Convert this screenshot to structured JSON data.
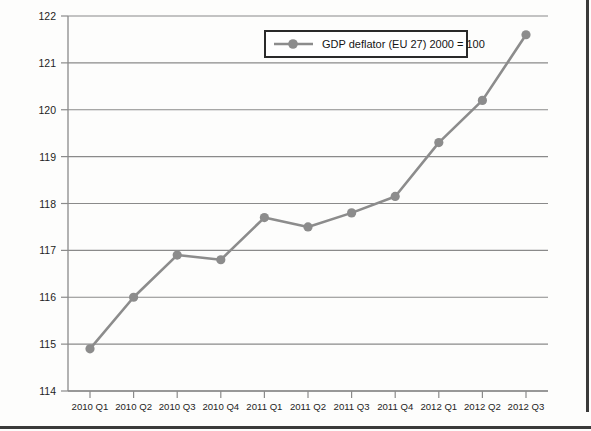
{
  "chart_data": {
    "type": "line",
    "title": "",
    "subtitle": "",
    "xlabel": "",
    "ylabel": "",
    "categories": [
      "2010 Q1",
      "2010 Q2",
      "2010 Q3",
      "2010 Q4",
      "2011 Q1",
      "2011 Q2",
      "2011 Q3",
      "2011 Q4",
      "2012 Q1",
      "2012 Q2",
      "2012 Q3"
    ],
    "series": [
      {
        "name": "GDP deflator (EU 27) 2000 = 100",
        "values": [
          114.9,
          116.0,
          116.9,
          116.8,
          117.7,
          117.5,
          117.8,
          118.15,
          119.3,
          120.2,
          121.6
        ],
        "color": "#8c8c8c",
        "marker": "circle"
      }
    ],
    "ylim": [
      114,
      122
    ],
    "ytick_labels": [
      "114",
      "115",
      "116",
      "117",
      "118",
      "119",
      "120",
      "121",
      "122"
    ],
    "ytick_values": [
      114,
      115,
      116,
      117,
      118,
      119,
      120,
      121,
      122
    ],
    "grid": true,
    "grid_axis": "y",
    "legend": {
      "position": "top-right",
      "entries": [
        "GDP deflator (EU 27) 2000 = 100"
      ]
    }
  },
  "colors": {
    "series": "#8c8c8c",
    "grid": "#8a8a8a",
    "axis": "#8a8a8a",
    "text": "#1d1d1d",
    "legend_border": "#2a2a2a",
    "frame": "#3a3a3a",
    "background": "#fdfdfc"
  }
}
